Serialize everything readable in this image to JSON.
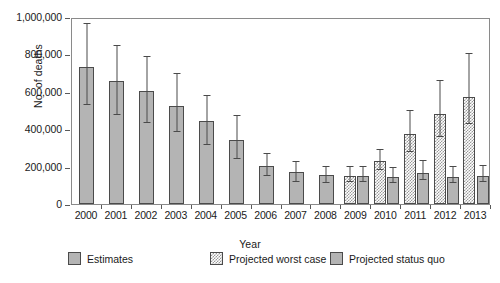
{
  "chart_data": {
    "type": "bar",
    "title": "",
    "xlabel": "Year",
    "ylabel": "No. of deaths",
    "ylim": [
      0,
      1000000
    ],
    "ytick_values": [
      0,
      200000,
      400000,
      600000,
      800000,
      1000000
    ],
    "ytick_labels": [
      "0",
      "200,000",
      "400,000",
      "600,000",
      "800,000",
      "1,000,000"
    ],
    "grid": false,
    "legend_position": "bottom",
    "categories": [
      "2000",
      "2001",
      "2002",
      "2003",
      "2004",
      "2005",
      "2006",
      "2007",
      "2008",
      "2009",
      "2010",
      "2011",
      "2012",
      "2013"
    ],
    "series": [
      {
        "name": "Estimates",
        "pattern": "solid",
        "values": [
          735000,
          660000,
          605000,
          525000,
          445000,
          340000,
          205000,
          170000,
          155000,
          null,
          null,
          null,
          null,
          null
        ],
        "err_low": [
          530000,
          475000,
          435000,
          385000,
          315000,
          240000,
          150000,
          120000,
          115000,
          null,
          null,
          null,
          null,
          null
        ],
        "err_high": [
          965000,
          845000,
          785000,
          695000,
          580000,
          470000,
          270000,
          225000,
          200000,
          null,
          null,
          null,
          null,
          null
        ]
      },
      {
        "name": "Projected worst case",
        "pattern": "check",
        "values": [
          null,
          null,
          null,
          null,
          null,
          null,
          null,
          null,
          null,
          152000,
          228000,
          372000,
          480000,
          570000
        ],
        "err_low": [
          null,
          null,
          null,
          null,
          null,
          null,
          null,
          null,
          null,
          120000,
          180000,
          280000,
          360000,
          430000
        ],
        "err_high": [
          null,
          null,
          null,
          null,
          null,
          null,
          null,
          null,
          null,
          200000,
          290000,
          500000,
          660000,
          800000
        ]
      },
      {
        "name": "Projected status quo",
        "pattern": "solid",
        "values": [
          null,
          null,
          null,
          null,
          null,
          null,
          null,
          null,
          null,
          150000,
          143000,
          165000,
          145000,
          152000
        ],
        "err_low": [
          null,
          null,
          null,
          null,
          null,
          null,
          null,
          null,
          null,
          118000,
          112000,
          128000,
          112000,
          118000
        ],
        "err_high": [
          null,
          null,
          null,
          null,
          null,
          null,
          null,
          null,
          null,
          198000,
          190000,
          228000,
          196000,
          205000
        ]
      }
    ]
  },
  "axis": {
    "y_title": "No. of deaths",
    "x_title": "Year"
  },
  "legend": {
    "items": [
      {
        "label": "Estimates",
        "pattern": "solid"
      },
      {
        "label": "Projected worst case",
        "pattern": "check"
      },
      {
        "label": "Projected status quo",
        "pattern": "solid"
      }
    ]
  }
}
